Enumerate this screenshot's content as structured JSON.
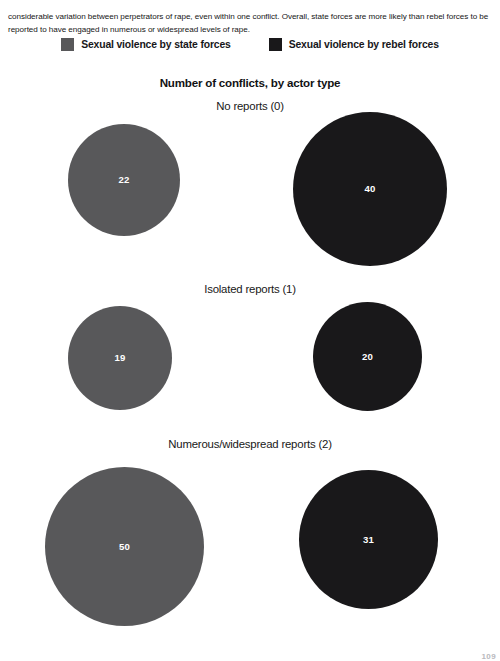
{
  "intro": {
    "paragraph": "considerable variation between perpetrators of rape, even within one conflict. Overall, state forces are more likely than rebel forces to be reported to have engaged in numerous or widespread levels of rape."
  },
  "legend": {
    "entries": [
      {
        "label": "Sexual violence by state forces",
        "color": "#58585a",
        "swatch_name": "legend-swatch-state-forces"
      },
      {
        "label": "Sexual violence by rebel forces",
        "color": "#19181a",
        "swatch_name": "legend-swatch-rebel-forces"
      }
    ]
  },
  "footer": {
    "page_artifact": "109"
  },
  "chart_data": {
    "type": "bubble",
    "title": "Number of conflicts, by actor type",
    "xlabel": "",
    "ylabel": "Number of conflicts",
    "grid": false,
    "legend_position": "top-center",
    "categories": [
      "No reports (0)",
      "Isolated reports (1)",
      "Numerous/widespread reports (2)"
    ],
    "series": [
      {
        "name": "Sexual violence by state forces",
        "color": "#58585a",
        "values": [
          22,
          19,
          50
        ]
      },
      {
        "name": "Sexual violence by rebel forces",
        "color": "#19181a",
        "values": [
          40,
          20,
          31
        ]
      }
    ],
    "annotations": [
      {
        "group": "No reports (0)",
        "series": "Sexual violence by state forces",
        "value": "22"
      },
      {
        "group": "No reports (0)",
        "series": "Sexual violence by rebel forces",
        "value": "40"
      },
      {
        "group": "Isolated reports (1)",
        "series": "Sexual violence by state forces",
        "value": "19"
      },
      {
        "group": "Isolated reports (1)",
        "series": "Sexual violence by rebel forces",
        "value": "20"
      },
      {
        "group": "Numerous/widespread reports (2)",
        "series": "Sexual violence by state forces",
        "value": "50"
      },
      {
        "group": "Numerous/widespread reports (2)",
        "series": "Sexual violence by rebel forces",
        "value": "31"
      }
    ]
  }
}
